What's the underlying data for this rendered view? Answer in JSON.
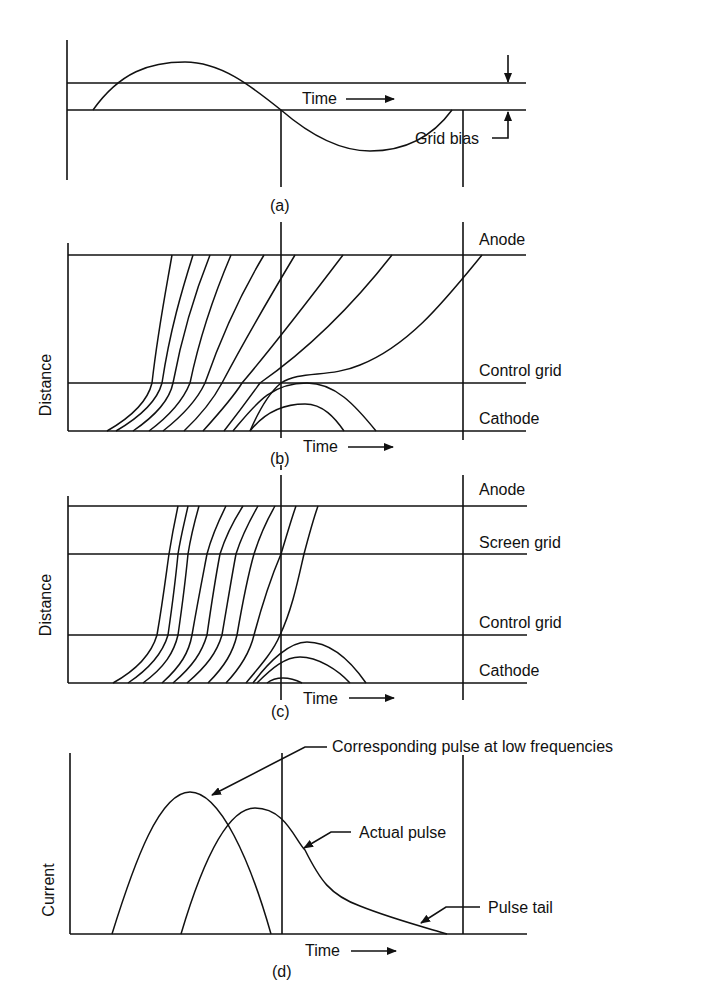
{
  "figure": {
    "panels": [
      {
        "id": "a",
        "caption": "(a)",
        "time_label": "Time",
        "annotations": [
          "Grid bias"
        ]
      },
      {
        "id": "b",
        "caption": "(b)",
        "y_label": "Distance",
        "time_label": "Time",
        "electrodes": [
          "Anode",
          "Control grid",
          "Cathode"
        ]
      },
      {
        "id": "c",
        "caption": "(c)",
        "y_label": "Distance",
        "time_label": "Time",
        "electrodes": [
          "Anode",
          "Screen grid",
          "Control grid",
          "Cathode"
        ]
      },
      {
        "id": "d",
        "caption": "(d)",
        "y_label": "Current",
        "time_label": "Time",
        "annotations": [
          "Corresponding pulse at low frequencies",
          "Actual pulse",
          "Pulse tail"
        ]
      }
    ],
    "colors": {
      "ink": "#111111",
      "background": "#ffffff"
    }
  }
}
